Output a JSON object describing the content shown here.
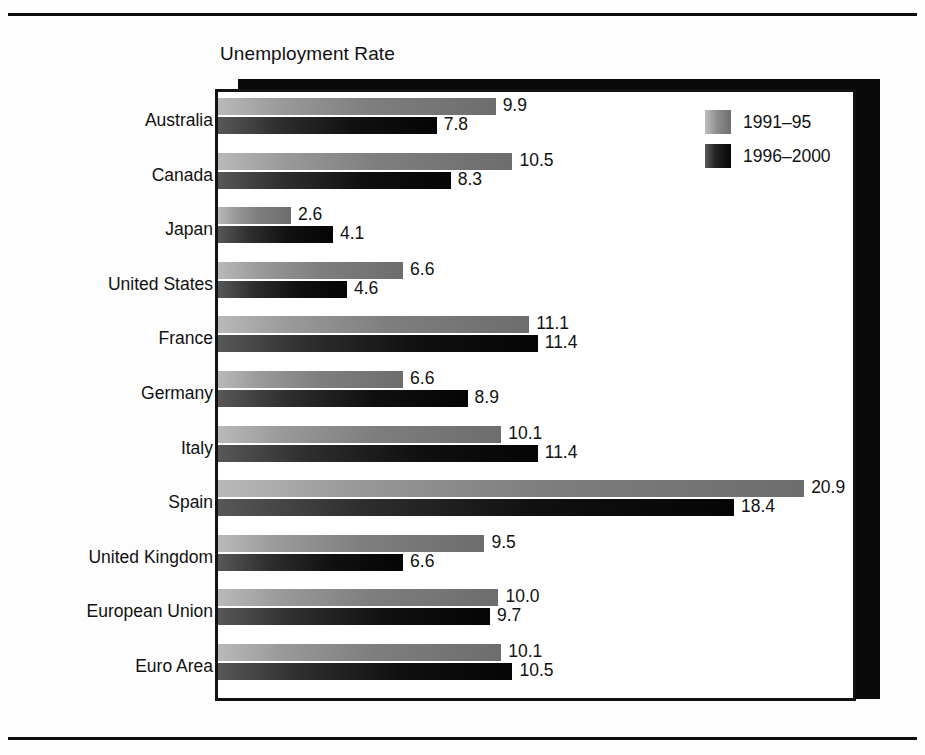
{
  "rules": {
    "top": "",
    "bottom": ""
  },
  "legend": {
    "position": "top-right",
    "entries": [
      {
        "label": "1991–95",
        "color": "#8f8f8f"
      },
      {
        "label": "1996–2000",
        "color": "#0a0a0a"
      }
    ]
  },
  "chart_data": {
    "type": "bar",
    "orientation": "horizontal",
    "title": "Unemployment Rate",
    "xlabel": "",
    "ylabel": "",
    "grid": false,
    "xlim": [
      0,
      22.5
    ],
    "legend_position": "top-right",
    "categories": [
      "Australia",
      "Canada",
      "Japan",
      "United States",
      "France",
      "Germany",
      "Italy",
      "Spain",
      "United Kingdom",
      "European Union",
      "Euro Area"
    ],
    "series": [
      {
        "name": "1991–95",
        "color": "#8f8f8f",
        "values": [
          9.9,
          10.5,
          2.6,
          6.6,
          11.1,
          6.6,
          10.1,
          20.9,
          9.5,
          10.0,
          10.1
        ],
        "labels": [
          "9.9",
          "10.5",
          "2.6",
          "6.6",
          "11.1",
          "6.6",
          "10.1",
          "20.9",
          "9.5",
          "10.0",
          "10.1"
        ]
      },
      {
        "name": "1996–2000",
        "color": "#0a0a0a",
        "values": [
          7.8,
          8.3,
          4.1,
          4.6,
          11.4,
          8.9,
          11.4,
          18.4,
          6.6,
          9.7,
          10.5
        ],
        "labels": [
          "7.8",
          "8.3",
          "4.1",
          "4.6",
          "11.4",
          "8.9",
          "11.4",
          "18.4",
          "6.6",
          "9.7",
          "10.5"
        ]
      }
    ]
  }
}
